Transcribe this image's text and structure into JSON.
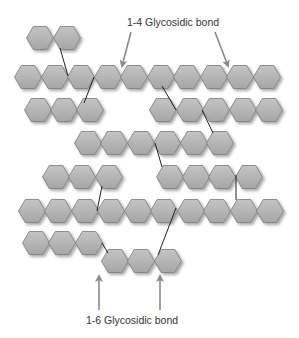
{
  "diagram": {
    "labels": {
      "top": "1-4 Glycosidic bond",
      "bottom": "1-6 Glycosidic bond"
    },
    "colors": {
      "hex_fill_light": "#c4c4c4",
      "hex_fill_dark": "#a6a6a6",
      "hex_stroke": "#7a7a7a",
      "bond_line": "#222222",
      "arrow": "#8a8a8a"
    },
    "hex": {
      "w": 27,
      "h": 23
    },
    "rows": [
      {
        "name": "row-1",
        "y": 38,
        "x": [
          40,
          67
        ]
      },
      {
        "name": "row-2",
        "y": 77,
        "x": [
          28,
          55,
          81,
          108,
          134,
          161,
          187,
          214,
          240,
          267
        ]
      },
      {
        "name": "row-3-left",
        "y": 110,
        "x": [
          38,
          64,
          90
        ]
      },
      {
        "name": "row-3-right",
        "y": 110,
        "x": [
          163,
          190,
          216,
          243,
          269
        ]
      },
      {
        "name": "row-4",
        "y": 143,
        "x": [
          88,
          114,
          141,
          167,
          194,
          220
        ]
      },
      {
        "name": "row-5-left",
        "y": 177,
        "x": [
          56,
          82,
          109
        ]
      },
      {
        "name": "row-5-right",
        "y": 177,
        "x": [
          170,
          196,
          222,
          249
        ]
      },
      {
        "name": "row-6",
        "y": 211,
        "x": [
          32,
          58,
          85,
          111,
          138,
          164,
          191,
          217,
          244,
          270
        ]
      },
      {
        "name": "row-7",
        "y": 243,
        "x": [
          36,
          62,
          89
        ]
      },
      {
        "name": "row-8",
        "y": 261,
        "x": [
          115,
          141,
          168
        ]
      }
    ],
    "bonds": [
      {
        "x1": 60,
        "y1": 48,
        "x2": 68,
        "y2": 76
      },
      {
        "x1": 94,
        "y1": 77,
        "x2": 84,
        "y2": 103
      },
      {
        "x1": 162,
        "y1": 86,
        "x2": 176,
        "y2": 110
      },
      {
        "x1": 202,
        "y1": 110,
        "x2": 213,
        "y2": 133
      },
      {
        "x1": 155,
        "y1": 143,
        "x2": 162,
        "y2": 167
      },
      {
        "x1": 102,
        "y1": 186,
        "x2": 97,
        "y2": 211
      },
      {
        "x1": 236,
        "y1": 175,
        "x2": 236,
        "y2": 200
      },
      {
        "x1": 176,
        "y1": 208,
        "x2": 158,
        "y2": 255
      },
      {
        "x1": 102,
        "y1": 243,
        "x2": 108,
        "y2": 253
      }
    ],
    "arrows": [
      {
        "name": "arrow-1-4-left",
        "x1": 131,
        "y1": 32,
        "x2": 122,
        "y2": 66
      },
      {
        "name": "arrow-1-4-right",
        "x1": 215,
        "y1": 32,
        "x2": 228,
        "y2": 66
      },
      {
        "name": "arrow-1-6-left",
        "x1": 99,
        "y1": 310,
        "x2": 99,
        "y2": 276
      },
      {
        "name": "arrow-1-6-right",
        "x1": 160,
        "y1": 310,
        "x2": 160,
        "y2": 276
      }
    ],
    "label_positions": {
      "top": {
        "x": 173,
        "y": 16
      },
      "bottom": {
        "x": 132,
        "y": 314
      }
    }
  }
}
